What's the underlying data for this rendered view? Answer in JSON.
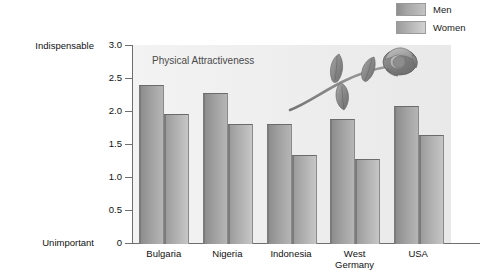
{
  "legend": {
    "position": "top-right",
    "items": [
      {
        "label": "Men",
        "series_key": "men",
        "swatch": "gradient-gray-dark"
      },
      {
        "label": "Women",
        "series_key": "women",
        "swatch": "gradient-gray-light"
      }
    ]
  },
  "axis": {
    "y_top_label": "Indispensable",
    "y_bottom_label": "Unimportant",
    "ticks": [
      {
        "value": 3.0,
        "label": "3.0"
      },
      {
        "value": 2.5,
        "label": "2.5"
      },
      {
        "value": 2.0,
        "label": "2.0"
      },
      {
        "value": 1.5,
        "label": "1.5"
      },
      {
        "value": 1.0,
        "label": "1.0"
      },
      {
        "value": 0.5,
        "label": "0.5"
      },
      {
        "value": 0.0,
        "label": "0"
      }
    ]
  },
  "decoration": {
    "rose": "rose-illustration"
  },
  "chart_data": {
    "type": "bar",
    "title": "Physical Attractiveness",
    "xlabel": "",
    "ylabel": "",
    "ylim": [
      0,
      3.0
    ],
    "grid": false,
    "legend_position": "top-right",
    "y_axis_anchor_labels": {
      "max": "Indispensable",
      "min": "Unimportant"
    },
    "categories": [
      "Bulgaria",
      "Nigeria",
      "Indonesia",
      "West\nGermany",
      "USA"
    ],
    "series": [
      {
        "name": "Men",
        "values": [
          2.4,
          2.28,
          1.8,
          1.88,
          2.08
        ]
      },
      {
        "name": "Women",
        "values": [
          1.96,
          1.8,
          1.34,
          1.28,
          1.64
        ]
      }
    ]
  }
}
